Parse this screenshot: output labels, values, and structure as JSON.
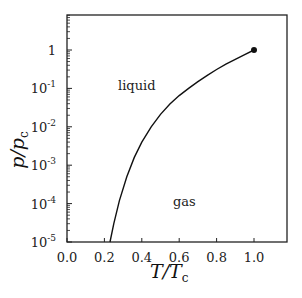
{
  "chart_data": {
    "type": "line",
    "title": "",
    "xlabel": "T/T_c",
    "ylabel": "p/p_c",
    "xlabel_main": "T/T",
    "xlabel_sub": "c",
    "ylabel_main": "p/p",
    "ylabel_sub": "c",
    "xlim": [
      0.0,
      1.18
    ],
    "ylim": [
      1e-05,
      10
    ],
    "yscale": "log",
    "grid": false,
    "x_ticks": [
      "0.0",
      "0.2",
      "0.4",
      "0.6",
      "0.8",
      "1.0"
    ],
    "y_ticks": [
      {
        "base": "10",
        "exp": "-5"
      },
      {
        "base": "10",
        "exp": "-4"
      },
      {
        "base": "10",
        "exp": "-3"
      },
      {
        "base": "10",
        "exp": "-2"
      },
      {
        "base": "10",
        "exp": "-1"
      },
      {
        "base": "1",
        "exp": ""
      }
    ],
    "series": [
      {
        "name": "liquid-gas coexistence curve",
        "x": [
          0.23,
          0.25,
          0.28,
          0.32,
          0.36,
          0.4,
          0.45,
          0.5,
          0.55,
          0.6,
          0.65,
          0.7,
          0.75,
          0.8,
          0.85,
          0.9,
          0.95,
          1.0
        ],
        "y": [
          1e-05,
          3e-05,
          0.00012,
          0.0005,
          0.0016,
          0.004,
          0.01,
          0.021,
          0.039,
          0.065,
          0.1,
          0.15,
          0.22,
          0.31,
          0.43,
          0.57,
          0.76,
          1.0
        ]
      }
    ],
    "annotations": [
      {
        "text": "liquid",
        "x": 0.37,
        "y": 0.13
      },
      {
        "text": "gas",
        "x": 0.55,
        "y": 0.00011
      },
      {
        "text": "critical point",
        "marker": "dot",
        "x": 1.0,
        "y": 1.0
      }
    ]
  },
  "labels": {
    "liquid": "liquid",
    "gas": "gas"
  }
}
